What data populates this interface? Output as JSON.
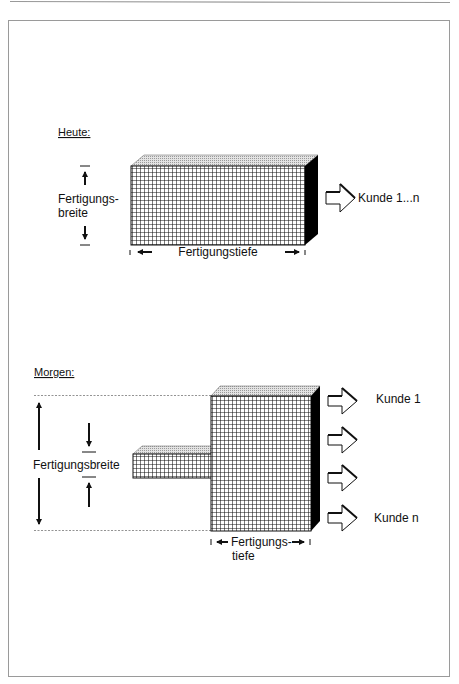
{
  "colors": {
    "ink": "#111111",
    "frame": "#9a9a9a",
    "top_face": "#d8d8d8",
    "side_face": "#000000",
    "grid_bg": "#ffffff"
  },
  "heute": {
    "heading": "Heute:",
    "width_label_line1": "Fertigungs-",
    "width_label_line2": "breite",
    "depth_label": "Fertigungstiefe",
    "customer_label": "Kunde 1...n"
  },
  "morgen": {
    "heading": "Morgen:",
    "width_label": "Fertigungsbreite",
    "depth_label_line1": "Fertigungs-",
    "depth_label_line2": "tiefe",
    "customer_first": "Kunde 1",
    "customer_last": "Kunde n",
    "arrow_count": 4
  }
}
